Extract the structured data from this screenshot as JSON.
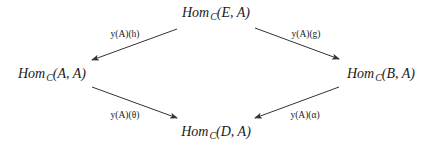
{
  "nodes": {
    "top": {
      "hom": "Hom",
      "cat": "C",
      "args": "(E, A)"
    },
    "left": {
      "hom": "Hom",
      "cat": "C",
      "args": "(A, A)"
    },
    "right": {
      "hom": "Hom",
      "cat": "C",
      "args": "(B, A)"
    },
    "bottom": {
      "hom": "Hom",
      "cat": "C",
      "args": "(D, A)"
    }
  },
  "arrows": {
    "top_to_left": {
      "label": "y(A)(h)"
    },
    "top_to_right": {
      "label": "y(A)(g)"
    },
    "left_to_bottom": {
      "label": "y(A)(θ)"
    },
    "right_to_bottom": {
      "label": "y(A)(α)"
    }
  }
}
